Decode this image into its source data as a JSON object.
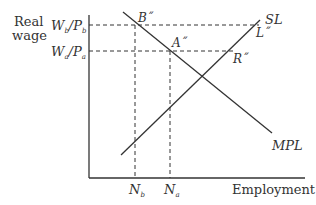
{
  "diagram": {
    "y_axis_label_line1": "Real",
    "y_axis_label_line2": "wage",
    "x_axis_label": "Employment",
    "wage_b_label": {
      "W": "W",
      "sub1": "b",
      "slash": "/",
      "P": "P",
      "sub2": "b"
    },
    "wage_a_label": {
      "W": "W",
      "sub1": "a",
      "slash": "/",
      "P": "P",
      "sub2": "a"
    },
    "emp_b_label": {
      "N": "N",
      "sub": "b"
    },
    "emp_a_label": {
      "N": "N",
      "sub": "a"
    },
    "point_b": "B˝",
    "point_a": "A˝",
    "point_l": "L˝",
    "point_r": "R˝",
    "curve_sl": "SL",
    "curve_mpl": "MPL",
    "colors": {
      "line": "#333333",
      "text": "#333333",
      "background": "#ffffff"
    }
  }
}
